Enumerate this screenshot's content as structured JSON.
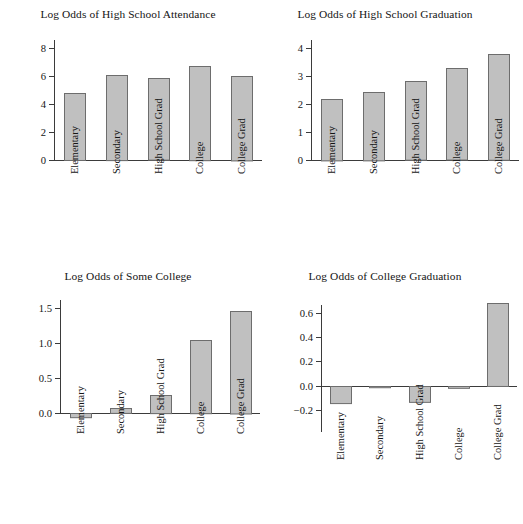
{
  "figure": {
    "background": "#ffffff",
    "bar_fill": "#c0c0c0",
    "bar_stroke": "#6d6d6d",
    "axis_color": "#3b3b3b",
    "width": 513,
    "height": 524
  },
  "chart_data": [
    {
      "id": "high-school-attendance",
      "type": "bar",
      "title": "Log Odds of High School Attendance",
      "xlabel": "",
      "ylabel": "",
      "categories": [
        "Elementary",
        "Secondary",
        "High School Grad",
        "College",
        "College Grad"
      ],
      "values": [
        4.8,
        6.1,
        5.85,
        6.75,
        6.05
      ],
      "yticks": [
        0,
        2,
        4,
        6,
        8
      ],
      "ytick_labels": [
        "0",
        "2",
        "4",
        "6",
        "8"
      ],
      "ylim": [
        0,
        8.6
      ],
      "grid": false,
      "legend": "none"
    },
    {
      "id": "high-school-graduation",
      "type": "bar",
      "title": "Log Odds of High School Graduation",
      "xlabel": "",
      "ylabel": "",
      "categories": [
        "Elementary",
        "Secondary",
        "High School Grad",
        "College",
        "College Grad"
      ],
      "values": [
        2.2,
        2.45,
        2.82,
        3.28,
        3.79
      ],
      "yticks": [
        0,
        1,
        2,
        3,
        4
      ],
      "ytick_labels": [
        "0",
        "1",
        "2",
        "3",
        "4"
      ],
      "ylim": [
        0,
        4.3
      ],
      "grid": false,
      "legend": "none"
    },
    {
      "id": "some-college",
      "type": "bar",
      "title": "Log Odds of Some College",
      "xlabel": "",
      "ylabel": "",
      "categories": [
        "Elementary",
        "Secondary",
        "High School Grad",
        "College",
        "College Grad"
      ],
      "values": [
        -0.06,
        0.07,
        0.26,
        1.05,
        1.47
      ],
      "yticks": [
        0.0,
        0.5,
        1.0,
        1.5
      ],
      "ytick_labels": [
        "0.0",
        "0.5",
        "1.0",
        "1.5"
      ],
      "ylim": [
        -0.1,
        1.65
      ],
      "grid": false,
      "legend": "none"
    },
    {
      "id": "college-graduation",
      "type": "bar",
      "title": "Log Odds of College Graduation",
      "xlabel": "",
      "ylabel": "",
      "categories": [
        "Elementary",
        "Secondary",
        "High School Grad",
        "College",
        "College Grad"
      ],
      "values": [
        -0.14,
        -0.01,
        -0.13,
        -0.015,
        0.68
      ],
      "yticks": [
        -0.2,
        0.0,
        0.2,
        0.4,
        0.6
      ],
      "ytick_labels": [
        "−0.2",
        "0.0",
        "0.2",
        "0.4",
        "0.6"
      ],
      "ylim": [
        -0.28,
        0.72
      ],
      "grid": false,
      "legend": "none"
    }
  ]
}
